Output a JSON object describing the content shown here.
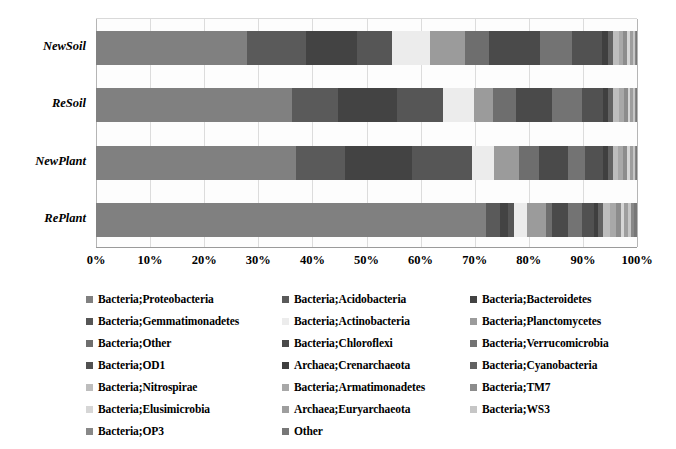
{
  "chart_data": {
    "type": "bar",
    "orientation": "horizontal",
    "stacked": true,
    "normalized": "100%",
    "title": "",
    "xlabel": "",
    "ylabel": "",
    "xlim": [
      0,
      100
    ],
    "grid": true,
    "legend_position": "bottom",
    "tick_labels": [
      "0%",
      "10%",
      "20%",
      "30%",
      "40%",
      "50%",
      "60%",
      "70%",
      "80%",
      "90%",
      "100%"
    ],
    "tick_values": [
      0,
      10,
      20,
      30,
      40,
      50,
      60,
      70,
      80,
      90,
      100
    ],
    "categories": [
      "NewSoil",
      "ReSoil",
      "NewPlant",
      "RePlant"
    ],
    "series": [
      {
        "name": "Bacteria;Proteobacteria",
        "color": "#808080",
        "values": [
          28.0,
          36.2,
          37.0,
          72.0
        ]
      },
      {
        "name": "Bacteria;Acidobacteria",
        "color": "#5a5a5a",
        "values": [
          11.0,
          8.5,
          9.0,
          2.6
        ]
      },
      {
        "name": "Bacteria;Bacteroidetes",
        "color": "#434343",
        "values": [
          9.5,
          11.0,
          12.5,
          1.6
        ]
      },
      {
        "name": "Bacteria;Gemmatimonadetes",
        "color": "#565656",
        "values": [
          6.5,
          8.5,
          11.0,
          1.1
        ]
      },
      {
        "name": "Bacteria;Actinobacteria",
        "color": "#ececec",
        "values": [
          7.0,
          5.8,
          4.2,
          2.4
        ]
      },
      {
        "name": "Bacteria;Planctomycetes",
        "color": "#9b9b9b",
        "values": [
          6.5,
          3.4,
          4.6,
          3.4
        ]
      },
      {
        "name": "Bacteria;Other",
        "color": "#6e6e6e",
        "values": [
          4.5,
          4.4,
          3.6,
          1.2
        ]
      },
      {
        "name": "Bacteria;Chloroflexi",
        "color": "#4a4a4a",
        "values": [
          9.5,
          6.6,
          5.4,
          3.0
        ]
      },
      {
        "name": "Bacteria;Verrucomicrobia",
        "color": "#737373",
        "values": [
          6.0,
          5.6,
          3.2,
          2.6
        ]
      },
      {
        "name": "Bacteria;OD1",
        "color": "#515151",
        "values": [
          5.5,
          3.8,
          3.4,
          2.2
        ]
      },
      {
        "name": "Archaea;Crenarchaeota",
        "color": "#3f3f3f",
        "values": [
          1.2,
          1.0,
          0.9,
          0.8
        ]
      },
      {
        "name": "Bacteria;Cyanobacteria",
        "color": "#626262",
        "values": [
          0.9,
          0.9,
          0.8,
          0.9
        ]
      },
      {
        "name": "Bacteria;Nitrospirae",
        "color": "#bdbdbd",
        "values": [
          1.0,
          1.1,
          1.0,
          1.3
        ]
      },
      {
        "name": "Bacteria;Armatimonadetes",
        "color": "#a8a8a8",
        "values": [
          0.9,
          0.9,
          0.9,
          1.0
        ]
      },
      {
        "name": "Bacteria;TM7",
        "color": "#8c8c8c",
        "values": [
          0.7,
          0.7,
          0.7,
          0.9
        ]
      },
      {
        "name": "Bacteria;Elusimicrobia",
        "color": "#d6d6d6",
        "values": [
          0.5,
          0.5,
          0.6,
          0.7
        ]
      },
      {
        "name": "Archaea;Euryarchaeota",
        "color": "#9e9e9e",
        "values": [
          0.5,
          0.5,
          0.5,
          0.6
        ]
      },
      {
        "name": "Bacteria;WS3",
        "color": "#c6c6c6",
        "values": [
          0.4,
          0.4,
          0.4,
          0.6
        ]
      },
      {
        "name": "Bacteria;OP3",
        "color": "#888888",
        "values": [
          0.2,
          0.2,
          0.3,
          0.6
        ]
      },
      {
        "name": "Other",
        "color": "#777777",
        "values": [
          0.2,
          0.1,
          0.1,
          0.5
        ]
      }
    ]
  },
  "legend": {
    "items": [
      {
        "label": "Bacteria;Proteobacteria",
        "color": "#808080",
        "swatch_icon": "legend-swatch-icon"
      },
      {
        "label": "Bacteria;Acidobacteria",
        "color": "#5a5a5a",
        "swatch_icon": "legend-swatch-icon"
      },
      {
        "label": "Bacteria;Bacteroidetes",
        "color": "#434343",
        "swatch_icon": "legend-swatch-icon"
      },
      {
        "label": "Bacteria;Gemmatimonadetes",
        "color": "#565656",
        "swatch_icon": "legend-swatch-icon"
      },
      {
        "label": "Bacteria;Actinobacteria",
        "color": "#ececec",
        "swatch_icon": "legend-swatch-icon"
      },
      {
        "label": "Bacteria;Planctomycetes",
        "color": "#9b9b9b",
        "swatch_icon": "legend-swatch-icon"
      },
      {
        "label": "Bacteria;Other",
        "color": "#6e6e6e",
        "swatch_icon": "legend-swatch-icon"
      },
      {
        "label": "Bacteria;Chloroflexi",
        "color": "#4a4a4a",
        "swatch_icon": "legend-swatch-icon"
      },
      {
        "label": "Bacteria;Verrucomicrobia",
        "color": "#737373",
        "swatch_icon": "legend-swatch-icon"
      },
      {
        "label": "Bacteria;OD1",
        "color": "#515151",
        "swatch_icon": "legend-swatch-icon"
      },
      {
        "label": "Archaea;Crenarchaeota",
        "color": "#3f3f3f",
        "swatch_icon": "legend-swatch-icon"
      },
      {
        "label": "Bacteria;Cyanobacteria",
        "color": "#626262",
        "swatch_icon": "legend-swatch-icon"
      },
      {
        "label": "Bacteria;Nitrospirae",
        "color": "#bdbdbd",
        "swatch_icon": "legend-swatch-icon"
      },
      {
        "label": "Bacteria;Armatimonadetes",
        "color": "#a8a8a8",
        "swatch_icon": "legend-swatch-icon"
      },
      {
        "label": "Bacteria;TM7",
        "color": "#8c8c8c",
        "swatch_icon": "legend-swatch-icon"
      },
      {
        "label": "Bacteria;Elusimicrobia",
        "color": "#d6d6d6",
        "swatch_icon": "legend-swatch-icon"
      },
      {
        "label": "Archaea;Euryarchaeota",
        "color": "#9e9e9e",
        "swatch_icon": "legend-swatch-icon"
      },
      {
        "label": "Bacteria;WS3",
        "color": "#c6c6c6",
        "swatch_icon": "legend-swatch-icon"
      },
      {
        "label": "Bacteria;OP3",
        "color": "#888888",
        "swatch_icon": "legend-swatch-icon"
      },
      {
        "label": "Other",
        "color": "#777777",
        "swatch_icon": "legend-swatch-icon"
      }
    ]
  },
  "style": {
    "background": "#ffffff",
    "gridline_color": "#dcdcdc",
    "axis_color": "#9a9a9a",
    "text_color": "#000000"
  }
}
